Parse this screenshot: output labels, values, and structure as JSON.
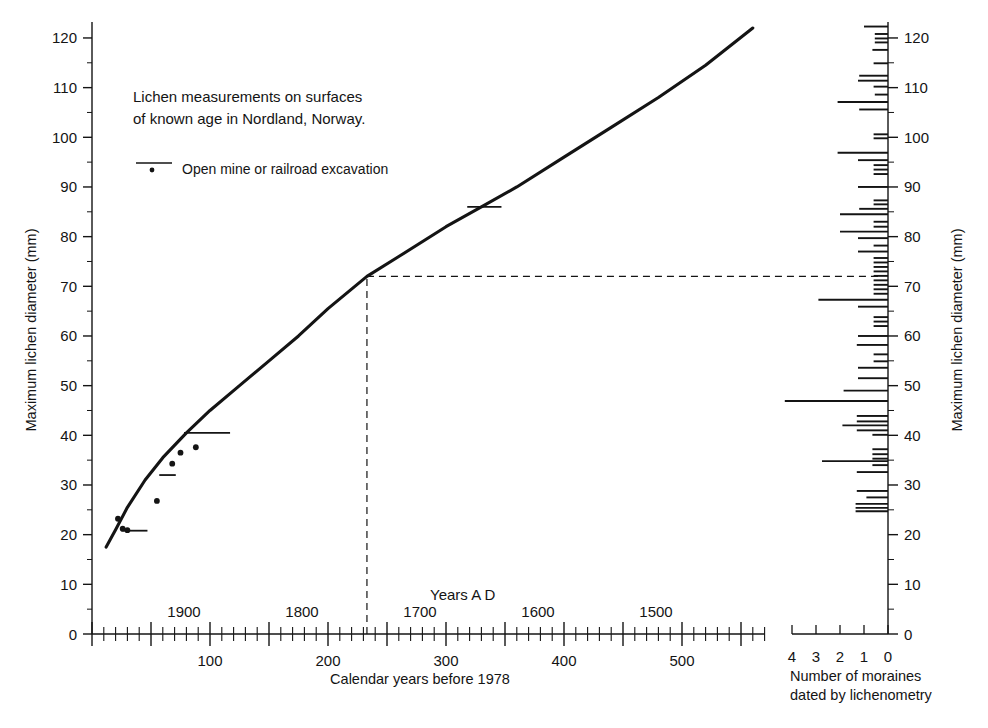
{
  "figure": {
    "annotation_line1": "Lichen measurements on surfaces",
    "annotation_line2": "of known age in Nordland, Norway.",
    "legend_label": "Open mine or railroad excavation",
    "years_ad_label": "Years A D"
  },
  "axes": {
    "left_title": "Maximum lichen diameter (mm)",
    "right_title": "Maximum lichen diameter (mm)",
    "bottom_title": "Calendar years before 1978",
    "histogram_title_line1": "Number of moraines",
    "histogram_title_line2": "dated by lichenometry",
    "y_ticks": [
      "0",
      "10",
      "20",
      "30",
      "40",
      "50",
      "60",
      "70",
      "80",
      "90",
      "100",
      "110",
      "120"
    ],
    "x_ticks_years_before": [
      "0",
      "100",
      "200",
      "300",
      "400",
      "500"
    ],
    "x_ticks_years_ad": [
      "1900",
      "1800",
      "1700",
      "1600",
      "1500"
    ],
    "histogram_ticks": [
      "4",
      "3",
      "2",
      "1",
      "0"
    ]
  },
  "chart_data": {
    "type": "line",
    "title": "Lichen measurements on surfaces of known age in Nordland, Norway.",
    "xlabel": "Calendar years before 1978",
    "ylabel": "Maximum lichen diameter (mm)",
    "xlim": [
      0,
      580
    ],
    "ylim": [
      0,
      125
    ],
    "grid": false,
    "legend_position": "upper-left",
    "series": [
      {
        "name": "Lichen growth curve",
        "type": "line",
        "x": [
          12,
          20,
          30,
          45,
          60,
          80,
          100,
          125,
          150,
          175,
          200,
          233,
          260,
          300,
          330,
          360,
          400,
          440,
          480,
          520,
          560
        ],
        "y": [
          17.5,
          21.0,
          25.5,
          31.0,
          35.5,
          40.5,
          45.0,
          50.0,
          55.0,
          60.0,
          65.5,
          72.0,
          76.0,
          82.0,
          86.0,
          90.0,
          96.0,
          102.0,
          108.0,
          114.5,
          122.0
        ]
      },
      {
        "name": "Open mine or railroad excavation (points)",
        "type": "scatter",
        "points": [
          {
            "x": 22,
            "y": 23.2
          },
          {
            "x": 26,
            "y": 21.2
          },
          {
            "x": 30,
            "y": 20.9
          },
          {
            "x": 55,
            "y": 26.8
          },
          {
            "x": 68,
            "y": 34.3
          },
          {
            "x": 75,
            "y": 36.5
          },
          {
            "x": 88,
            "y": 37.6
          }
        ]
      },
      {
        "name": "Open mine or railroad excavation (age bars)",
        "type": "hbar",
        "bars": [
          {
            "y": 20.8,
            "x_start": 25,
            "x_end": 47
          },
          {
            "y": 32.0,
            "x_start": 57,
            "x_end": 71
          },
          {
            "y": 40.5,
            "x_start": 78,
            "x_end": 117
          },
          {
            "y": 86.0,
            "x_start": 318,
            "x_end": 347
          }
        ]
      }
    ],
    "reference_lines": [
      {
        "orientation": "vertical",
        "x": 233,
        "style": "dashed",
        "from_y": 0,
        "to_y": 72
      },
      {
        "orientation": "horizontal",
        "y": 72,
        "style": "dashed",
        "from_x": 233,
        "to_x": 880
      }
    ],
    "histogram": {
      "type": "hbar",
      "orientation": "horizontal-left",
      "xlabel": "Number of moraines dated by lichenometry",
      "ylabel": "Maximum lichen diameter (mm)",
      "xlim": [
        0,
        4.6
      ],
      "bars": [
        {
          "y": 122.3,
          "count": 1.0
        },
        {
          "y": 120.8,
          "count": 0.55
        },
        {
          "y": 119.9,
          "count": 0.55
        },
        {
          "y": 119.1,
          "count": 0.55
        },
        {
          "y": 117.6,
          "count": 0.65
        },
        {
          "y": 114.9,
          "count": 0.6
        },
        {
          "y": 112.4,
          "count": 1.2
        },
        {
          "y": 111.4,
          "count": 1.25
        },
        {
          "y": 110.2,
          "count": 0.6
        },
        {
          "y": 108.6,
          "count": 0.55
        },
        {
          "y": 107.1,
          "count": 2.1
        },
        {
          "y": 105.6,
          "count": 1.2
        },
        {
          "y": 100.6,
          "count": 0.6
        },
        {
          "y": 99.8,
          "count": 0.6
        },
        {
          "y": 96.9,
          "count": 2.1
        },
        {
          "y": 95.4,
          "count": 1.25
        },
        {
          "y": 94.4,
          "count": 0.6
        },
        {
          "y": 93.5,
          "count": 0.6
        },
        {
          "y": 92.6,
          "count": 0.6
        },
        {
          "y": 90.0,
          "count": 1.25
        },
        {
          "y": 87.3,
          "count": 0.6
        },
        {
          "y": 86.5,
          "count": 0.6
        },
        {
          "y": 85.6,
          "count": 1.2
        },
        {
          "y": 84.5,
          "count": 2.0
        },
        {
          "y": 83.0,
          "count": 0.6
        },
        {
          "y": 82.0,
          "count": 0.6
        },
        {
          "y": 81.0,
          "count": 2.0
        },
        {
          "y": 79.7,
          "count": 1.25
        },
        {
          "y": 78.2,
          "count": 0.6
        },
        {
          "y": 77.0,
          "count": 1.25
        },
        {
          "y": 75.7,
          "count": 0.6
        },
        {
          "y": 74.8,
          "count": 0.6
        },
        {
          "y": 73.9,
          "count": 0.6
        },
        {
          "y": 73.0,
          "count": 0.6
        },
        {
          "y": 72.1,
          "count": 0.6
        },
        {
          "y": 71.2,
          "count": 0.6
        },
        {
          "y": 70.3,
          "count": 0.6
        },
        {
          "y": 69.4,
          "count": 0.6
        },
        {
          "y": 68.5,
          "count": 0.6
        },
        {
          "y": 67.3,
          "count": 2.9
        },
        {
          "y": 65.9,
          "count": 1.25
        },
        {
          "y": 63.8,
          "count": 0.6
        },
        {
          "y": 62.9,
          "count": 0.6
        },
        {
          "y": 62.0,
          "count": 0.6
        },
        {
          "y": 60.0,
          "count": 1.25
        },
        {
          "y": 58.2,
          "count": 1.3
        },
        {
          "y": 56.3,
          "count": 0.6
        },
        {
          "y": 54.9,
          "count": 0.6
        },
        {
          "y": 53.6,
          "count": 1.25
        },
        {
          "y": 51.5,
          "count": 1.25
        },
        {
          "y": 49.0,
          "count": 1.85
        },
        {
          "y": 46.9,
          "count": 4.3
        },
        {
          "y": 43.9,
          "count": 1.3
        },
        {
          "y": 42.8,
          "count": 1.3
        },
        {
          "y": 42.0,
          "count": 1.9
        },
        {
          "y": 41.0,
          "count": 1.3
        },
        {
          "y": 40.1,
          "count": 0.65
        },
        {
          "y": 37.2,
          "count": 0.65
        },
        {
          "y": 36.2,
          "count": 0.65
        },
        {
          "y": 35.3,
          "count": 0.65
        },
        {
          "y": 34.8,
          "count": 2.75
        },
        {
          "y": 34.0,
          "count": 0.65
        },
        {
          "y": 32.6,
          "count": 1.3
        },
        {
          "y": 28.8,
          "count": 1.3
        },
        {
          "y": 27.5,
          "count": 0.9
        },
        {
          "y": 26.2,
          "count": 1.35
        },
        {
          "y": 25.4,
          "count": 1.35
        },
        {
          "y": 24.7,
          "count": 1.35
        }
      ]
    }
  }
}
